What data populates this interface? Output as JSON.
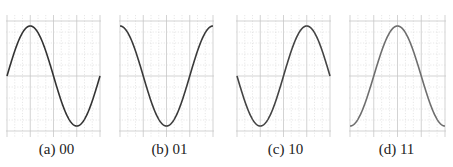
{
  "chart_data": [
    {
      "type": "line",
      "id": "a",
      "caption": "(a) 00",
      "function": "sin",
      "phase_deg": 0,
      "x": [
        0,
        45,
        90,
        135,
        180,
        225,
        270,
        315,
        360
      ],
      "values": [
        0,
        0.707,
        1,
        0.707,
        0,
        -0.707,
        -1,
        -0.707,
        0
      ],
      "xlim": [
        0,
        360
      ],
      "ylim": [
        -1.1,
        1.1
      ],
      "grid": true,
      "line_color": "#333333",
      "title": "",
      "xlabel": "",
      "ylabel": ""
    },
    {
      "type": "line",
      "id": "b",
      "caption": "(b) 01",
      "function": "cos",
      "phase_deg": 90,
      "x": [
        0,
        45,
        90,
        135,
        180,
        225,
        270,
        315,
        360
      ],
      "values": [
        1,
        0.707,
        0,
        -0.707,
        -1,
        -0.707,
        0,
        0.707,
        1
      ],
      "xlim": [
        0,
        360
      ],
      "ylim": [
        -1.1,
        1.1
      ],
      "grid": true,
      "line_color": "#3a3a3a",
      "title": "",
      "xlabel": "",
      "ylabel": ""
    },
    {
      "type": "line",
      "id": "c",
      "caption": "(c) 10",
      "function": "-sin",
      "phase_deg": 180,
      "x": [
        0,
        45,
        90,
        135,
        180,
        225,
        270,
        315,
        360
      ],
      "values": [
        0,
        -0.707,
        -1,
        -0.707,
        0,
        0.707,
        1,
        0.707,
        0
      ],
      "xlim": [
        0,
        360
      ],
      "ylim": [
        -1.1,
        1.1
      ],
      "grid": true,
      "line_color": "#444444",
      "title": "",
      "xlabel": "",
      "ylabel": ""
    },
    {
      "type": "line",
      "id": "d",
      "caption": "(d) 11",
      "function": "-cos",
      "phase_deg": 270,
      "x": [
        0,
        45,
        90,
        135,
        180,
        225,
        270,
        315,
        360
      ],
      "values": [
        -1,
        -0.707,
        0,
        0.707,
        1,
        0.707,
        0,
        -0.707,
        -1
      ],
      "xlim": [
        0,
        360
      ],
      "ylim": [
        -1.1,
        1.1
      ],
      "grid": true,
      "line_color": "#6e6e6e",
      "title": "",
      "xlabel": "",
      "ylabel": ""
    }
  ]
}
